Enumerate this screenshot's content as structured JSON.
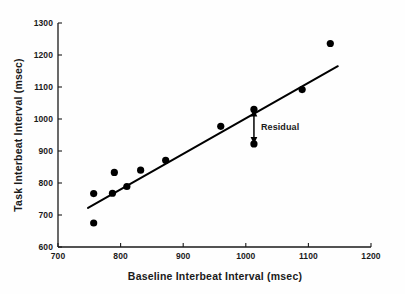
{
  "chart_data": {
    "type": "scatter",
    "title": "",
    "xlabel": "Baseline Interbeat Interval (msec)",
    "ylabel": "Task Interbeat Interval (msec)",
    "xlim": [
      700,
      1200
    ],
    "ylim": [
      600,
      1300
    ],
    "xticks": [
      700,
      800,
      900,
      1000,
      1100,
      1200
    ],
    "yticks": [
      600,
      700,
      800,
      900,
      1000,
      1100,
      1200,
      1300
    ],
    "xtick_labels": [
      "700",
      "800",
      "900",
      "1000",
      "1100",
      "1200"
    ],
    "ytick_labels": [
      "600",
      "700",
      "800",
      "900",
      "1000",
      "1100",
      "1200",
      "1300"
    ],
    "grid": false,
    "legend": null,
    "marker": "filled-circle",
    "marker_color": "#000000",
    "points": [
      {
        "x": 757,
        "y": 767
      },
      {
        "x": 757,
        "y": 675
      },
      {
        "x": 787,
        "y": 768
      },
      {
        "x": 790,
        "y": 833
      },
      {
        "x": 810,
        "y": 789
      },
      {
        "x": 832,
        "y": 840
      },
      {
        "x": 872,
        "y": 871
      },
      {
        "x": 960,
        "y": 977
      },
      {
        "x": 1013,
        "y": 1030
      },
      {
        "x": 1013,
        "y": 922
      },
      {
        "x": 1090,
        "y": 1092
      },
      {
        "x": 1135,
        "y": 1236
      }
    ],
    "series": [
      {
        "name": "Interbeat interval observations",
        "x": [
          757,
          757,
          787,
          790,
          810,
          832,
          872,
          960,
          1013,
          1013,
          1090,
          1135
        ],
        "values": [
          767,
          675,
          768,
          833,
          789,
          840,
          871,
          977,
          1030,
          922,
          1092,
          1236
        ]
      }
    ],
    "trendline": {
      "type": "linear-regression",
      "x_start": 748,
      "y_start": 722,
      "x_end": 1147,
      "y_end": 1165,
      "color": "#000000"
    },
    "annotations": [
      {
        "label": "Residual",
        "type": "double-headed-arrow",
        "x": 1013,
        "y_top": 1030,
        "y_bottom": 922,
        "text_x": 1030,
        "text_y": 980
      }
    ]
  },
  "axes": {
    "x_title": "Baseline Interbeat Interval (msec)",
    "y_title": "Task Interbeat Interval (msec)"
  },
  "annotation": {
    "residual_label": "Residual"
  }
}
